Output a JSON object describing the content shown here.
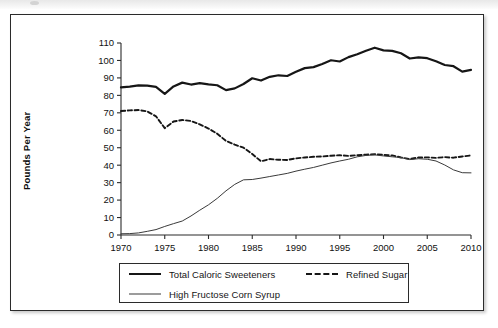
{
  "figure": {
    "y_axis_title": "Pounds Per Year"
  },
  "legend": {
    "entries": [
      {
        "label": "Total Caloric Sweeteners",
        "style": "solid-thick",
        "swatch": "swatch-thick"
      },
      {
        "label": "Refined Sugar",
        "style": "dashed",
        "swatch": "swatch-dashed"
      },
      {
        "label": "High Fructose Corn Syrup",
        "style": "solid-thin",
        "swatch": "swatch-thin"
      }
    ]
  },
  "chart_data": {
    "type": "line",
    "title": "",
    "subtitle": "",
    "xlabel": "",
    "ylabel": "Pounds Per Year",
    "xlim": [
      1970,
      2010
    ],
    "ylim": [
      0,
      110
    ],
    "xticks": [
      1970,
      1975,
      1980,
      1985,
      1990,
      1995,
      2000,
      2005,
      2010
    ],
    "yticks": [
      0,
      10,
      20,
      30,
      40,
      50,
      60,
      70,
      80,
      90,
      100,
      110
    ],
    "grid": false,
    "legend_position": "bottom",
    "x": [
      1970,
      1971,
      1972,
      1973,
      1974,
      1975,
      1976,
      1977,
      1978,
      1979,
      1980,
      1981,
      1982,
      1983,
      1984,
      1985,
      1986,
      1987,
      1988,
      1989,
      1990,
      1991,
      1992,
      1993,
      1994,
      1995,
      1996,
      1997,
      1998,
      1999,
      2000,
      2001,
      2002,
      2003,
      2004,
      2005,
      2006,
      2007,
      2008,
      2009,
      2010
    ],
    "series": [
      {
        "name": "Total Caloric Sweeteners",
        "style": "solid-thick",
        "color": "#161616",
        "values": [
          84.6,
          85.0,
          85.7,
          85.6,
          84.9,
          80.9,
          85.1,
          87.3,
          86.2,
          87.0,
          86.3,
          85.8,
          83.0,
          84.0,
          86.5,
          89.8,
          88.5,
          90.6,
          91.5,
          91.1,
          93.5,
          95.6,
          96.2,
          98.0,
          100.1,
          99.4,
          101.9,
          103.6,
          105.6,
          107.3,
          105.8,
          105.5,
          104.1,
          101.1,
          101.8,
          101.3,
          99.5,
          97.4,
          96.7,
          93.6,
          94.6
        ]
      },
      {
        "name": "Refined Sugar",
        "style": "dashed",
        "color": "#161616",
        "values": [
          71.0,
          71.4,
          71.6,
          70.8,
          68.0,
          61.2,
          65.0,
          65.9,
          65.3,
          63.4,
          61.0,
          58.0,
          53.9,
          51.8,
          50.0,
          46.4,
          42.2,
          43.5,
          43.1,
          43.0,
          43.9,
          44.4,
          44.8,
          45.0,
          45.4,
          45.7,
          45.3,
          45.7,
          46.0,
          46.3,
          45.9,
          45.6,
          44.4,
          43.5,
          44.4,
          44.5,
          44.2,
          44.6,
          44.3,
          45.0,
          45.6
        ]
      },
      {
        "name": "High Fructose Corn Syrup",
        "style": "solid-thin",
        "color": "#3a3a3a",
        "values": [
          0.7,
          0.8,
          1.2,
          2.1,
          3.1,
          4.9,
          6.5,
          8.0,
          10.9,
          14.2,
          17.3,
          21.0,
          25.3,
          29.0,
          31.6,
          31.8,
          32.6,
          33.5,
          34.4,
          35.3,
          36.6,
          37.7,
          38.7,
          40.0,
          41.3,
          42.4,
          43.4,
          44.8,
          45.6,
          45.9,
          45.3,
          44.8,
          44.4,
          43.2,
          43.7,
          43.4,
          42.4,
          40.1,
          37.3,
          35.7,
          35.6
        ]
      }
    ]
  }
}
